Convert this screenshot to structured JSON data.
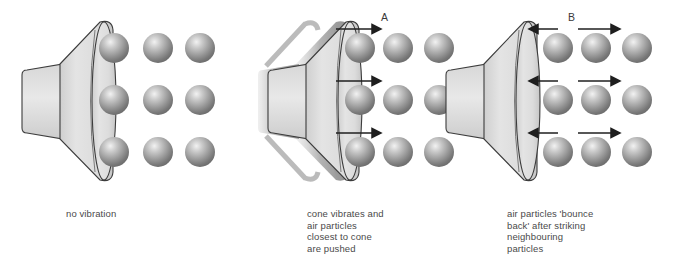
{
  "figure": {
    "background_color": "#ffffff",
    "text_color": "#4a4a4a",
    "sphere_color": "#8d8d8d",
    "cone_color": "#dcdcdc",
    "outline_color": "#3c3c3c"
  },
  "panels": [
    {
      "id": "panel-1",
      "letter": "",
      "caption_lines": [
        "no vibration"
      ],
      "caption": "no vibration",
      "cone_vibrating": false,
      "arrows": [],
      "particle_columns": 3,
      "particle_rows": 3,
      "state": "rest"
    },
    {
      "id": "panel-2",
      "letter": "A",
      "caption_lines": [
        "cone vibrates and",
        "air particles",
        "closest to cone",
        "are pushed"
      ],
      "caption": "cone vibrates and\nair particles\nclosest to cone\nare pushed",
      "cone_vibrating": true,
      "arrows": [
        {
          "direction": "right",
          "row": 1,
          "label": "A"
        },
        {
          "direction": "right",
          "row": 2,
          "label": ""
        },
        {
          "direction": "right",
          "row": 3,
          "label": ""
        }
      ],
      "particle_columns": 3,
      "particle_rows": 3,
      "state": "compression"
    },
    {
      "id": "panel-3",
      "letter": "B",
      "caption_lines": [
        "air particles 'bounce",
        "back' after striking",
        "neighbouring",
        "particles"
      ],
      "caption": "air particles 'bounce\nback' after striking\nneighbouring\nparticles",
      "cone_vibrating": false,
      "arrows": [
        {
          "direction": "left",
          "row": 1,
          "label": ""
        },
        {
          "direction": "right",
          "row": 1,
          "label": "B"
        },
        {
          "direction": "left",
          "row": 2,
          "label": ""
        },
        {
          "direction": "right",
          "row": 2,
          "label": ""
        },
        {
          "direction": "left",
          "row": 3,
          "label": ""
        },
        {
          "direction": "right",
          "row": 3,
          "label": ""
        }
      ],
      "particle_columns": 3,
      "particle_rows": 3,
      "state": "rarefaction"
    }
  ]
}
